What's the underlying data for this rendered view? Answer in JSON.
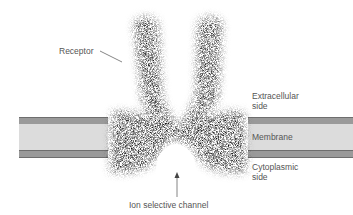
{
  "diagram": {
    "labels": {
      "receptor": "Receptor",
      "extracellular_line1": "Extracellular",
      "extracellular_line2": "side",
      "membrane": "Membrane",
      "cytoplasmic_line1": "Cytoplasmic",
      "cytoplasmic_line2": "side",
      "channel": "Ion selective channel"
    },
    "colors": {
      "membrane_band": "#9a9a9a",
      "membrane_core": "#dcdcdc",
      "protein": "#111111",
      "label_text": "#555555"
    }
  }
}
